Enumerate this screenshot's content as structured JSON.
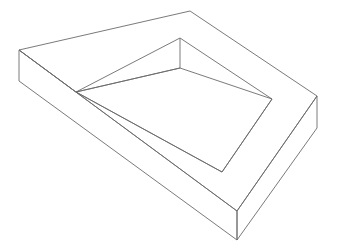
{
  "scene": {
    "title": "3D wireframe line drawing",
    "subject": "rectangular tray with raised rim and recessed inner cavity",
    "projection": "perspective",
    "background_color": "#ffffff",
    "line_color": "#6b6b6b",
    "line_width": 0.9,
    "width": 337,
    "height": 252
  },
  "geometry": {
    "outer_top_face": "190,11 317,96 237,211 19,50",
    "outer_left_side": "19,50 19,81 237,240 237,211",
    "outer_right_side": "237,211 237,240 317,128 317,96",
    "rim_inner_top": "180,38 272,99 222,172 76,92",
    "rim_back_vertical": "180,38 180,68",
    "rim_back_left_wall": "19,50 76,92",
    "cavity_floor": "180,68 272,99 222,172 76,92",
    "cavity_left_floor_edge": "76,92 180,68",
    "vertices": {
      "apex_back": [
        190,
        11
      ],
      "right_corner_top": [
        317,
        96
      ],
      "right_corner_bottom": [
        317,
        128
      ],
      "front_corner_top": [
        237,
        211
      ],
      "front_corner_bottom": [
        237,
        240
      ],
      "left_corner_top": [
        19,
        50
      ],
      "left_corner_bottom": [
        19,
        81
      ],
      "rim_inner_back_top": [
        180,
        38
      ],
      "rim_inner_back_bottom": [
        180,
        68
      ],
      "rim_inner_left": [
        76,
        92
      ],
      "rim_inner_right": [
        272,
        99
      ],
      "rim_inner_front": [
        222,
        172
      ]
    }
  },
  "labels": {
    "outer_top_face": "outer top surface",
    "outer_left_side": "outer left side wall",
    "outer_right_side": "outer right side wall",
    "rim_inner_top": "inner rim opening",
    "cavity_floor": "recessed cavity floor",
    "rim_back_vertical": "back inner wall edge"
  }
}
